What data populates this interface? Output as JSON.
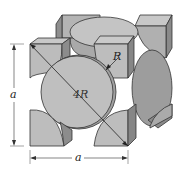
{
  "figure": {
    "type": "FCC unit cell (hard-sphere, reduced-sphere corner/face atoms)",
    "labels": {
      "height_dimension": "a",
      "width_dimension": "a",
      "face_diagonal": "4R",
      "radius": "R"
    },
    "colors": {
      "sphere_light": "#bdbdbd",
      "sphere_mid": "#a9a9a9",
      "sphere_dark": "#8a8a8a",
      "face_top": "#c8c8c8",
      "line": "#333333",
      "background": "#ffffff"
    }
  }
}
